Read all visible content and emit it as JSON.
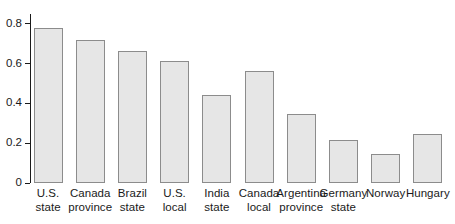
{
  "chart_data": {
    "type": "bar",
    "title": "",
    "subtitle": "",
    "xlabel": "",
    "ylabel": "",
    "categories": [
      "U.S. state",
      "Canada province",
      "Brazil state",
      "U.S. local",
      "India state",
      "Canada local",
      "Argentina province",
      "Germany state",
      "Norway",
      "Hungary"
    ],
    "category_lines": [
      [
        "U.S.",
        "state"
      ],
      [
        "Canada",
        "province"
      ],
      [
        "Brazil",
        "state"
      ],
      [
        "U.S.",
        "local"
      ],
      [
        "India",
        "state"
      ],
      [
        "Canada",
        "local"
      ],
      [
        "Argentina",
        "province"
      ],
      [
        "Germany",
        "state"
      ],
      [
        "Norway",
        ""
      ],
      [
        "Hungary",
        ""
      ]
    ],
    "values": [
      0.78,
      0.72,
      0.665,
      0.615,
      0.445,
      0.565,
      0.345,
      0.215,
      0.145,
      0.245
    ],
    "ylim": [
      0,
      0.85
    ],
    "yticks": [
      0,
      0.2,
      0.4,
      0.6,
      0.8
    ],
    "ytick_labels": [
      "0",
      "0.2",
      "0.4",
      "0.6",
      "0.8"
    ],
    "grid": false,
    "legend": false,
    "legend_position": "none",
    "bar_fill_color": "#e6e6e6",
    "bar_border_color": "#8c8c8c",
    "axis_color": "#1a1a1a",
    "background_color": "#ffffff"
  }
}
